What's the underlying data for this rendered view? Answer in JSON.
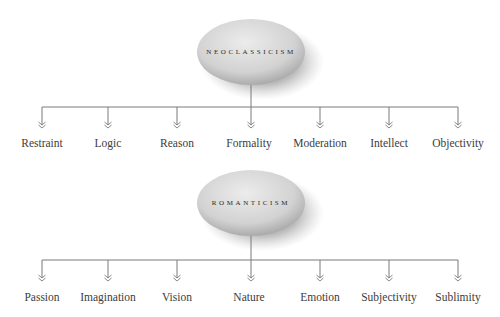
{
  "colors": {
    "line": "#7a7a7a",
    "text": "#3c3c3c",
    "ellipse_light": "#e6e6e6",
    "ellipse_dark": "#b4b4b4",
    "shadow": "#3a3a3a"
  },
  "diagrams": [
    {
      "root": "NEOCLASSICISM",
      "children": [
        "Restraint",
        "Logic",
        "Reason",
        "Formality",
        "Moderation",
        "Intellect",
        "Objectivity"
      ]
    },
    {
      "root": "ROMANTICISM",
      "children": [
        "Passion",
        "Imagination",
        "Vision",
        "Nature",
        "Emotion",
        "Subjectivity",
        "Sublimity"
      ]
    }
  ]
}
